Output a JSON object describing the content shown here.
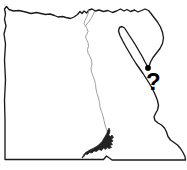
{
  "figure": {
    "name": "egypt-outline-map",
    "kind": "outline-map",
    "width": 187,
    "height": 170,
    "background_color": "#ffffff"
  },
  "map": {
    "region_name": "Egypt",
    "outline_color": "#1a1a1a",
    "fill_color": "#ffffff",
    "river_color": "#9a9a9a",
    "lake_color": "#222222",
    "features": [
      {
        "id": "country-border",
        "label": "Egypt national border",
        "type": "outline"
      },
      {
        "id": "nile-river",
        "label": "Nile River",
        "type": "river"
      },
      {
        "id": "lake-nasser",
        "label": "Lake Nasser",
        "type": "lake"
      },
      {
        "id": "sinai-peninsula",
        "label": "Sinai Peninsula",
        "type": "landform"
      },
      {
        "id": "gulf-of-suez",
        "label": "Gulf of Suez",
        "type": "water"
      },
      {
        "id": "gulf-of-aqaba",
        "label": "Gulf of Aqaba",
        "type": "water"
      },
      {
        "id": "red-sea-coast",
        "label": "Red Sea coast",
        "type": "coastline"
      },
      {
        "id": "mediterranean-coast",
        "label": "Mediterranean coast",
        "type": "coastline"
      }
    ]
  },
  "annotations": {
    "site_marker": {
      "name": "site-location-dot",
      "color": "#000000",
      "x": 148,
      "y": 68,
      "radius": 2.6
    },
    "query_label": {
      "name": "question-mark-label",
      "text": "?",
      "color": "#000000",
      "x": 146,
      "y": 70,
      "font_size_px": 24,
      "bold": true
    }
  }
}
